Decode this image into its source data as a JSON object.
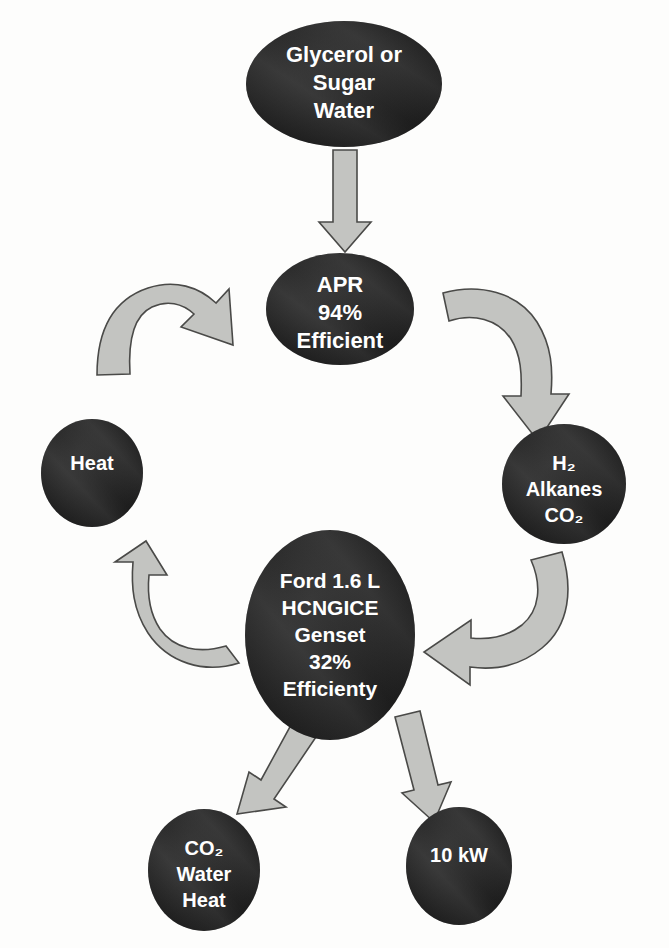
{
  "diagram": {
    "background_color": "#fdfdfc",
    "node_fill_color": "#262626",
    "node_text_color": "#ffffff",
    "arrow_fill_color": "#c3c4c1",
    "arrow_stroke_color": "#4a4a48",
    "nodes": [
      {
        "id": "feedstock",
        "name": "glycerol-sugar-water-node",
        "shape": "ellipse",
        "cx": 344,
        "cy": 84,
        "rx": 98,
        "ry": 63,
        "font_size": 22,
        "lines": [
          "Glycerol or",
          "Sugar",
          "Water"
        ]
      },
      {
        "id": "apr",
        "name": "apr-node",
        "shape": "ellipse",
        "cx": 340,
        "cy": 309,
        "rx": 74,
        "ry": 56,
        "font_size": 22,
        "lines": [
          "APR",
          "94%",
          "Efficient"
        ]
      },
      {
        "id": "heat",
        "name": "heat-node",
        "shape": "ellipse",
        "cx": 92,
        "cy": 473,
        "rx": 51,
        "ry": 54,
        "font_size": 20,
        "lines": [
          "Heat"
        ]
      },
      {
        "id": "products",
        "name": "hydrogen-alkanes-co2-node",
        "shape": "ellipse",
        "cx": 564,
        "cy": 484,
        "rx": 62,
        "ry": 60,
        "font_size": 20,
        "lines": [
          "H₂",
          "Alkanes",
          "CO₂"
        ]
      },
      {
        "id": "genset",
        "name": "ford-hcngice-genset-node",
        "shape": "ellipse",
        "cx": 330,
        "cy": 635,
        "rx": 85,
        "ry": 105,
        "font_size": 21,
        "lines": [
          "Ford 1.6 L",
          "HCNGICE",
          "Genset",
          "32%",
          "Efficienty"
        ]
      },
      {
        "id": "exhaust",
        "name": "co2-water-heat-node",
        "shape": "ellipse",
        "cx": 204,
        "cy": 870,
        "rx": 56,
        "ry": 61,
        "font_size": 20,
        "lines": [
          "CO₂",
          "Water",
          "Heat"
        ]
      },
      {
        "id": "power",
        "name": "ten-kilowatt-node",
        "shape": "ellipse",
        "cx": 459,
        "cy": 866,
        "rx": 53,
        "ry": 59,
        "font_size": 20,
        "lines": [
          "10 kW"
        ]
      }
    ],
    "arrows": [
      {
        "id": "feedstock-to-apr",
        "name": "arrow-feedstock-to-apr",
        "kind": "straight-down",
        "from": "feedstock",
        "to": "apr"
      },
      {
        "id": "heat-to-apr",
        "name": "arrow-heat-to-apr",
        "kind": "curved",
        "from": "heat",
        "to": "apr"
      },
      {
        "id": "apr-to-products",
        "name": "arrow-apr-to-products",
        "kind": "curved",
        "from": "apr",
        "to": "products"
      },
      {
        "id": "products-to-genset",
        "name": "arrow-products-to-genset",
        "kind": "curved",
        "from": "products",
        "to": "genset"
      },
      {
        "id": "genset-to-heat",
        "name": "arrow-genset-to-heat",
        "kind": "curved",
        "from": "genset",
        "to": "heat"
      },
      {
        "id": "genset-to-exhaust",
        "name": "arrow-genset-to-exhaust",
        "kind": "straight-diagonal",
        "from": "genset",
        "to": "exhaust"
      },
      {
        "id": "genset-to-power",
        "name": "arrow-genset-to-power",
        "kind": "straight-diagonal",
        "from": "genset",
        "to": "power"
      }
    ]
  }
}
